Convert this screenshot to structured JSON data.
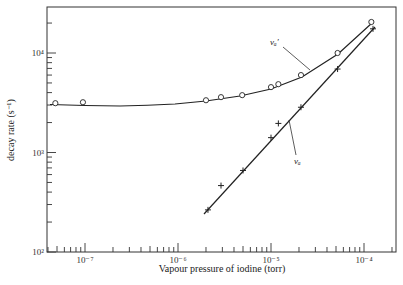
{
  "chart_data": {
    "type": "scatter",
    "title": "",
    "xlabel": "Vapour pressure of iodine (torr)",
    "ylabel": "decay rate (s⁻¹)",
    "xscale": "log",
    "yscale": "log",
    "xlim": [
      4e-08,
      0.00022
    ],
    "ylim": [
      100,
      30000
    ],
    "x_ticks": [
      {
        "value": 1e-07,
        "label": "10⁻⁷"
      },
      {
        "value": 1e-06,
        "label": "10⁻⁶"
      },
      {
        "value": 1e-05,
        "label": "10⁻⁵"
      },
      {
        "value": 0.0001,
        "label": "10⁻⁴"
      }
    ],
    "y_ticks": [
      {
        "value": 100,
        "label": "10²"
      },
      {
        "value": 1000,
        "label": "10³"
      },
      {
        "value": 10000,
        "label": "10⁴"
      }
    ],
    "grid": false,
    "legend": "none (curves labelled inline)",
    "series": [
      {
        "name": "νₐ′",
        "marker": "open-circle",
        "line": "smooth fitted curve",
        "x": [
          4.8e-08,
          9.5e-08,
          2e-06,
          2.9e-06,
          4.9e-06,
          1e-05,
          1.2e-05,
          2.1e-05,
          5.2e-05,
          0.00012
        ],
        "y": [
          3130,
          3200,
          3350,
          3600,
          3770,
          4540,
          4860,
          6000,
          10000,
          20500
        ]
      },
      {
        "name": "νₐ",
        "marker": "plus",
        "line": "straight fitted line",
        "x": [
          2.1e-06,
          2.9e-06,
          5e-06,
          1e-05,
          1.2e-05,
          2.1e-05,
          5.2e-05,
          0.000125
        ],
        "y": [
          265,
          465,
          660,
          1410,
          1960,
          2850,
          6900,
          17500
        ]
      }
    ],
    "annotations": [
      {
        "text": "νₐ′",
        "target_series": 0
      },
      {
        "text": "νₐ",
        "target_series": 1
      }
    ]
  },
  "labels": {
    "xlabel": "Vapour pressure of iodine (torr)",
    "ylabel": "decay rate (s⁻¹)",
    "series_a_prime": "νₐ′",
    "series_a": "νₐ"
  }
}
